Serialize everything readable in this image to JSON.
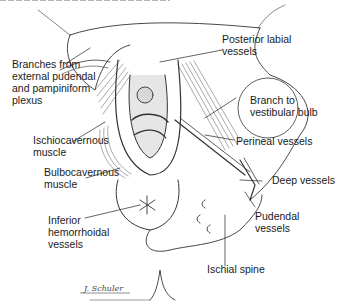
{
  "figure": {
    "caption_fragment": "(cut-off caption text at top edge)",
    "labels": [
      {
        "id": "posterior-labial",
        "text": "Posterior labial\nvessels"
      },
      {
        "id": "branches-external-pudendal",
        "text": "Branches from\nexternal pudendal\nand pampiniform\nplexus"
      },
      {
        "id": "branch-vestibular-bulb",
        "text": "Branch to\nvestibular bulb"
      },
      {
        "id": "ischiocavernous",
        "text": "Ischiocavernous\nmuscle"
      },
      {
        "id": "perineal-vessels",
        "text": "Perineal vessels"
      },
      {
        "id": "bulbocavernous",
        "text": "Bulbocavernous\nmuscle"
      },
      {
        "id": "deep-vessels",
        "text": "Deep vessels"
      },
      {
        "id": "inferior-hemorrhoidal",
        "text": "Inferior\nhemorrhoidal\nvessels"
      },
      {
        "id": "pudendal-vessels",
        "text": "Pudendal\nvessels"
      },
      {
        "id": "ischial-spine",
        "text": "Ischial spine"
      }
    ],
    "signature": "J. Schuler"
  }
}
